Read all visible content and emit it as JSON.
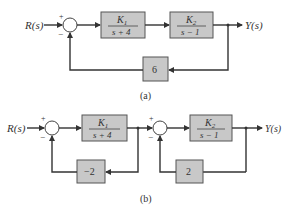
{
  "diagram_a": {
    "label": "(a)",
    "input": "R(s)",
    "output": "Y(s)",
    "summing_junction": {
      "top_sign": "+",
      "bottom_sign": "−"
    },
    "block1": {
      "numerator": "K",
      "num_sub": "1",
      "denominator": "s + 4"
    },
    "block2": {
      "numerator": "K",
      "num_sub": "2",
      "denominator": "s − 1"
    },
    "feedback_block": {
      "gain": "6"
    }
  },
  "diagram_b": {
    "label": "(b)",
    "input": "R(s)",
    "output": "Y(s)",
    "summing_junction_1": {
      "top_sign": "+",
      "bottom_sign": "−"
    },
    "summing_junction_2": {
      "top_sign": "+",
      "bottom_sign": "−"
    },
    "block1": {
      "numerator": "K",
      "num_sub": "1",
      "denominator": "s + 4"
    },
    "block2": {
      "numerator": "K",
      "num_sub": "2",
      "denominator": "s − 1"
    },
    "feedback_block_1": {
      "gain": "−2"
    },
    "feedback_block_2": {
      "gain": "2"
    }
  },
  "colors": {
    "block_fill": "#c8c8c8",
    "line": "#333333"
  }
}
